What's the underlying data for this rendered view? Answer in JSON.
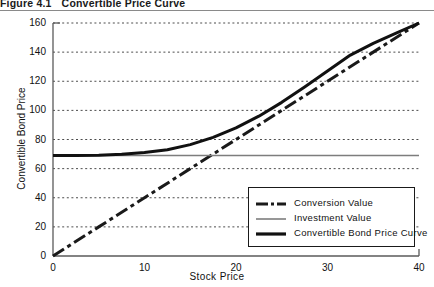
{
  "caption": {
    "number": "Figure 4.1",
    "title": "Convertible Price Curve"
  },
  "chart_data": {
    "type": "line",
    "title": "Convertible Price Curve",
    "xlabel": "Stock Price",
    "ylabel": "Convertible Bond Price",
    "xlim": [
      0,
      40
    ],
    "ylim": [
      0,
      160
    ],
    "xticks": [
      "0",
      "10",
      "20",
      "30",
      "40"
    ],
    "yticks": [
      "0",
      "20",
      "40",
      "60",
      "80",
      "100",
      "120",
      "140",
      "160"
    ],
    "grid": "horizontal-dotted",
    "legend_position": "lower-right",
    "series": [
      {
        "name": "Conversion Value",
        "style": "dash-dot",
        "color": "#1a1a1a",
        "x": [
          0,
          5,
          10,
          15,
          20,
          25,
          30,
          35,
          40
        ],
        "values": [
          0,
          20,
          40,
          60,
          80,
          100,
          120,
          140,
          160
        ]
      },
      {
        "name": "Investment Value",
        "style": "solid-thin",
        "color": "#7d7d7d",
        "x": [
          0,
          10,
          20,
          30,
          40
        ],
        "values": [
          69,
          69,
          69,
          69,
          69
        ]
      },
      {
        "name": "Convertible Bond Price Curve",
        "style": "solid-thick",
        "color": "#111111",
        "x": [
          0,
          2.5,
          5,
          7.5,
          10,
          12.5,
          15,
          17.5,
          20,
          22.5,
          25,
          27.5,
          30,
          32.5,
          35,
          37.5,
          40
        ],
        "values": [
          69,
          69,
          69.2,
          69.8,
          71,
          73,
          76.5,
          81.5,
          88,
          96,
          105.5,
          116,
          127,
          138,
          146,
          153,
          160
        ]
      }
    ]
  },
  "legend": {
    "items": [
      {
        "label": "Conversion Value",
        "style": "dash-dot"
      },
      {
        "label": "Investment Value",
        "style": "solid-thin"
      },
      {
        "label": "Convertible Bond Price Curve",
        "style": "solid-thick"
      }
    ]
  }
}
